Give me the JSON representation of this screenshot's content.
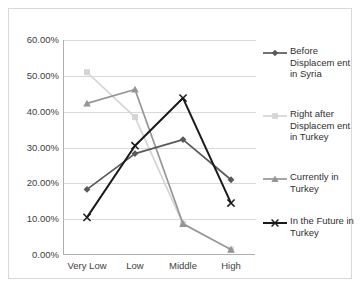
{
  "chart_data": {
    "type": "line",
    "title": "",
    "xlabel": "",
    "ylabel": "",
    "categories": [
      "Very Low",
      "Low",
      "Middle",
      "High"
    ],
    "ylim": [
      0,
      60
    ],
    "ytick_labels": [
      "0.00%",
      "10.00%",
      "20.00%",
      "30.00%",
      "40.00%",
      "50.00%",
      "60.00%"
    ],
    "ytick_values": [
      0,
      10,
      20,
      30,
      40,
      50,
      60
    ],
    "grid": true,
    "legend_position": "right",
    "series": [
      {
        "name": "Before Displacement in Syria",
        "marker": "diamond",
        "color": "#595959",
        "values": [
          18.3,
          28.3,
          32.2,
          21.0
        ]
      },
      {
        "name": "Right after Displacement in Turkey",
        "marker": "square",
        "color": "#d5d5d5",
        "values": [
          51.0,
          38.5,
          8.7,
          1.5
        ]
      },
      {
        "name": "Currently in Turkey",
        "marker": "triangle",
        "color": "#959595",
        "values": [
          42.3,
          46.2,
          8.7,
          1.5
        ]
      },
      {
        "name": "In the Future in Turkey",
        "marker": "x",
        "color": "#1a1a1a",
        "values": [
          10.5,
          30.5,
          43.8,
          14.5
        ]
      }
    ]
  },
  "legend": {
    "items": [
      {
        "label": "Before Displacem ent in Syria"
      },
      {
        "label": "Right after Displacem ent in Turkey"
      },
      {
        "label": "Currently in Turkey"
      },
      {
        "label": "In the Future in Turkey"
      }
    ]
  }
}
